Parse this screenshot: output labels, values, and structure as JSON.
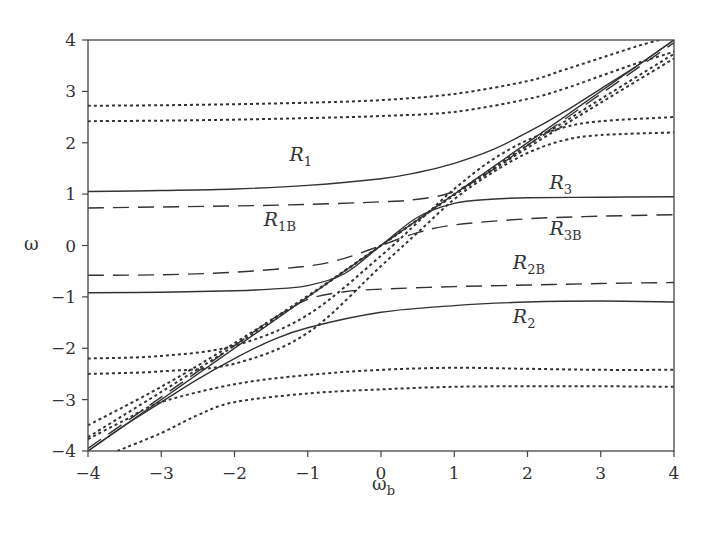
{
  "chart_data": {
    "type": "line",
    "title": "",
    "xlabel": "ω",
    "xlabel_sub": "b",
    "ylabel": "ω",
    "xlim": [
      -4,
      4
    ],
    "ylim": [
      -4,
      4
    ],
    "xticks": [
      -4,
      -3,
      -2,
      -1,
      0,
      1,
      2,
      3,
      4
    ],
    "yticks": [
      -4,
      -3,
      -2,
      -1,
      0,
      1,
      2,
      3,
      4
    ],
    "xtick_labels": [
      "−4",
      "−3",
      "−2",
      "−1",
      "0",
      "1",
      "2",
      "3",
      "4"
    ],
    "ytick_labels": [
      "−4",
      "−3",
      "−2",
      "−1",
      "0",
      "1",
      "2",
      "3",
      "4"
    ],
    "grid": false,
    "legend": "none (inline curve labels)",
    "series": [
      {
        "name": "diagonal ω = ω_b",
        "style": "solid",
        "x": [
          -4,
          4
        ],
        "y": [
          -4,
          4
        ]
      },
      {
        "name": "R1",
        "style": "solid",
        "x": [
          -4,
          -3,
          -2,
          -1,
          0,
          0.5,
          1,
          1.5,
          2,
          2.5,
          3,
          3.5,
          4
        ],
        "y": [
          1.05,
          1.07,
          1.1,
          1.17,
          1.3,
          1.42,
          1.6,
          1.85,
          2.2,
          2.6,
          3.05,
          3.5,
          4.0
        ]
      },
      {
        "name": "R3",
        "style": "solid",
        "x": [
          -4,
          -3,
          -2,
          -1.5,
          -1,
          -0.5,
          0,
          0.5,
          1,
          1.5,
          2,
          3,
          4
        ],
        "y": [
          -0.92,
          -0.91,
          -0.88,
          -0.85,
          -0.78,
          -0.55,
          0,
          0.55,
          0.82,
          0.9,
          0.93,
          0.94,
          0.95
        ]
      },
      {
        "name": "R2",
        "style": "solid",
        "x": [
          -4,
          -3.5,
          -3,
          -2.5,
          -2,
          -1.5,
          -1,
          0,
          1,
          2,
          3,
          4
        ],
        "y": [
          -4.0,
          -3.5,
          -3.05,
          -2.6,
          -2.2,
          -1.85,
          -1.6,
          -1.3,
          -1.17,
          -1.1,
          -1.08,
          -1.1
        ]
      },
      {
        "name": "R1B",
        "style": "dashed",
        "x": [
          -4,
          -3,
          -2,
          -1,
          0,
          0.5,
          1,
          1.5,
          2,
          3,
          4
        ],
        "y": [
          0.73,
          0.75,
          0.77,
          0.8,
          0.85,
          0.9,
          1.05,
          1.45,
          1.95,
          2.95,
          3.95
        ]
      },
      {
        "name": "R3B",
        "style": "dashed",
        "x": [
          -4,
          -3,
          -2,
          -1,
          -0.5,
          0,
          0.5,
          1,
          2,
          3,
          4
        ],
        "y": [
          -0.58,
          -0.57,
          -0.52,
          -0.4,
          -0.25,
          0,
          0.25,
          0.4,
          0.52,
          0.57,
          0.6
        ]
      },
      {
        "name": "R2B",
        "style": "dashed",
        "x": [
          -4,
          -3,
          -2,
          -1.5,
          -1,
          -0.5,
          0,
          1,
          2,
          3,
          4
        ],
        "y": [
          -3.95,
          -2.95,
          -1.95,
          -1.45,
          -1.05,
          -0.9,
          -0.85,
          -0.8,
          -0.77,
          -0.74,
          -0.72
        ]
      },
      {
        "name": "dotted upper 1",
        "style": "dotted",
        "x": [
          -4,
          -3,
          -2,
          -1,
          0,
          1,
          2,
          2.5,
          3,
          3.5,
          3.8
        ],
        "y": [
          2.72,
          2.73,
          2.75,
          2.78,
          2.83,
          2.95,
          3.2,
          3.42,
          3.65,
          3.88,
          4.0
        ]
      },
      {
        "name": "dotted upper 2",
        "style": "dotted",
        "x": [
          -4,
          -3,
          -2,
          -1,
          0,
          1,
          2,
          2.5,
          3,
          3.5,
          4
        ],
        "y": [
          2.42,
          2.43,
          2.45,
          2.48,
          2.52,
          2.6,
          2.85,
          3.05,
          3.3,
          3.55,
          3.77
        ]
      },
      {
        "name": "dotted diag A",
        "style": "dotted",
        "x": [
          -4,
          -3,
          -2,
          -1,
          0,
          1,
          2,
          3,
          4
        ],
        "y": [
          -3.5,
          -2.75,
          -1.9,
          -0.98,
          0,
          0.98,
          1.9,
          2.78,
          3.64
        ]
      },
      {
        "name": "dotted diag B",
        "style": "dotted",
        "x": [
          -4,
          -3,
          -2,
          -1,
          0,
          1,
          2,
          3,
          4
        ],
        "y": [
          -3.73,
          -2.85,
          -1.95,
          -1.0,
          0,
          1.0,
          1.95,
          2.85,
          3.73
        ]
      },
      {
        "name": "dotted mid upper 1",
        "style": "dotted",
        "x": [
          -4,
          -3,
          -2,
          -1,
          0,
          0.5,
          1,
          1.5,
          2,
          2.5,
          3,
          4
        ],
        "y": [
          -2.2,
          -2.15,
          -1.95,
          -1.35,
          -0.2,
          0.45,
          1.1,
          1.65,
          2.05,
          2.3,
          2.42,
          2.5
        ]
      },
      {
        "name": "dotted mid upper 2",
        "style": "dotted",
        "x": [
          -4,
          -3,
          -2,
          -1,
          0,
          0.5,
          1,
          1.5,
          2,
          2.5,
          3,
          4
        ],
        "y": [
          -2.5,
          -2.45,
          -2.3,
          -1.7,
          -0.4,
          0.25,
          0.9,
          1.4,
          1.8,
          2.05,
          2.15,
          2.2
        ]
      },
      {
        "name": "dotted lower 1",
        "style": "dotted",
        "x": [
          -4,
          -3.5,
          -3,
          -2,
          -1,
          0,
          1,
          2,
          3,
          4
        ],
        "y": [
          -3.77,
          -3.4,
          -3.05,
          -2.7,
          -2.52,
          -2.42,
          -2.38,
          -2.4,
          -2.42,
          -2.42
        ]
      },
      {
        "name": "dotted lower 2",
        "style": "dotted",
        "x": [
          -3.6,
          -3,
          -2.5,
          -2,
          -1,
          0,
          1,
          2,
          3,
          4
        ],
        "y": [
          -4.0,
          -3.65,
          -3.3,
          -3.05,
          -2.88,
          -2.8,
          -2.75,
          -2.74,
          -2.74,
          -2.75
        ]
      }
    ],
    "annotations": [
      {
        "text": "R",
        "sub": "1",
        "x": -1.25,
        "y": 1.65
      },
      {
        "text": "R",
        "sub": "1B",
        "x": -1.6,
        "y": 0.38
      },
      {
        "text": "R",
        "sub": "3",
        "x": 2.3,
        "y": 1.1
      },
      {
        "text": "R",
        "sub": "3B",
        "x": 2.3,
        "y": 0.2
      },
      {
        "text": "R",
        "sub": "2B",
        "x": 1.8,
        "y": -0.45
      },
      {
        "text": "R",
        "sub": "2",
        "x": 1.8,
        "y": -1.5
      }
    ]
  }
}
